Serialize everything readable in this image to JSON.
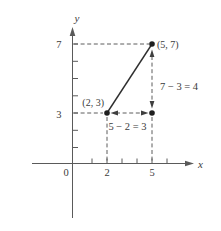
{
  "figure": {
    "background_color": "#ffffff",
    "ink_color": "#3b3b3b",
    "labels": {
      "y_axis": "y",
      "x_axis": "x",
      "origin": "0",
      "x_tick_2": "2",
      "x_tick_5": "5",
      "y_tick_3": "3",
      "y_tick_7": "7",
      "point_a": "(2, 3)",
      "point_b": "(5, 7)",
      "run_equation": "5 − 2 = 3",
      "rise_equation": "7 − 3 = 4"
    },
    "points": [
      {
        "name": "point-a",
        "x": 2,
        "y": 3,
        "label": "(2, 3)"
      },
      {
        "name": "point-b",
        "x": 5,
        "y": 7,
        "label": "(5, 7)"
      },
      {
        "name": "corner-point",
        "x": 5,
        "y": 3,
        "label": ""
      }
    ],
    "axis": {
      "x_labeled_ticks": [
        0,
        2,
        5
      ],
      "y_labeled_ticks": [
        3,
        7
      ],
      "x_minor_ticks": [
        1,
        2,
        3,
        4,
        5,
        6
      ],
      "y_minor_ticks": [
        1,
        2,
        3,
        4,
        5,
        6,
        7
      ]
    }
  }
}
